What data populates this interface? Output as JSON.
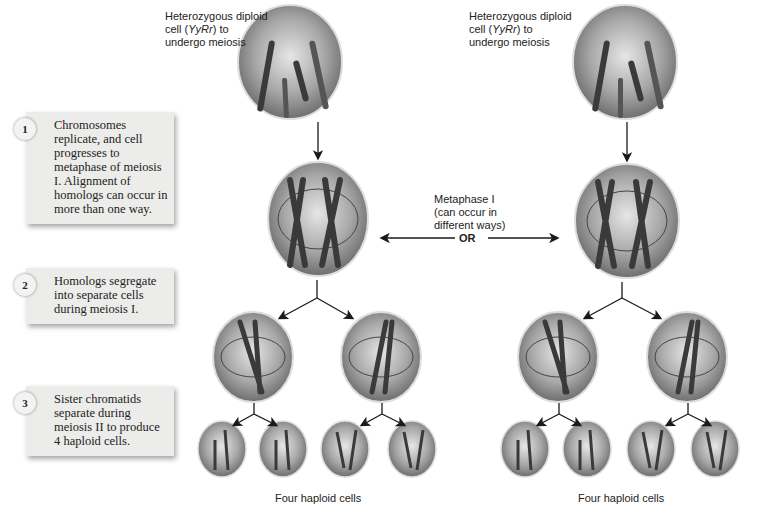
{
  "steps": [
    {
      "number": "1",
      "text": "Chromosomes replicate, and cell progresses to metaphase of meiosis I. Alignment of homologs can occur in more than one way."
    },
    {
      "number": "2",
      "text": "Homologs segregate into separate cells during meiosis I."
    },
    {
      "number": "3",
      "text": "Sister chromatids separate during meiosis II to produce 4 haploid cells."
    }
  ],
  "left": {
    "start_label_line1": "Heterozygous diploid",
    "start_label_line2_pre": "cell (",
    "start_label_genotype": "YyRr",
    "start_label_line2_post": ") to",
    "start_label_line3": "undergo meiosis",
    "haploid_caption": "Four haploid cells",
    "haploid_alleles": [
      [
        "R",
        "y"
      ],
      [
        "R",
        "y"
      ],
      [
        "r",
        "Y"
      ],
      [
        "r",
        "Y"
      ]
    ]
  },
  "right": {
    "start_label_line1": "Heterozygous diploid",
    "start_label_line2_pre": "cell (",
    "start_label_genotype": "YyRr",
    "start_label_line2_post": ") to",
    "start_label_line3": "undergo meiosis",
    "haploid_caption": "Four haploid cells",
    "haploid_alleles": [
      [
        "R",
        "Y"
      ],
      [
        "R",
        "Y"
      ],
      [
        "r",
        "y"
      ],
      [
        "r",
        "y"
      ]
    ]
  },
  "center": {
    "metaphase_line1": "Metaphase I",
    "metaphase_line2": "(can occur in",
    "metaphase_line3": "different ways)",
    "or_label": "OR"
  },
  "colors": {
    "box_bg": "#ececea",
    "cell_fill": "#9a9a9a",
    "chromosome": "#3a3a3a",
    "arrow": "#1a1a1a"
  }
}
